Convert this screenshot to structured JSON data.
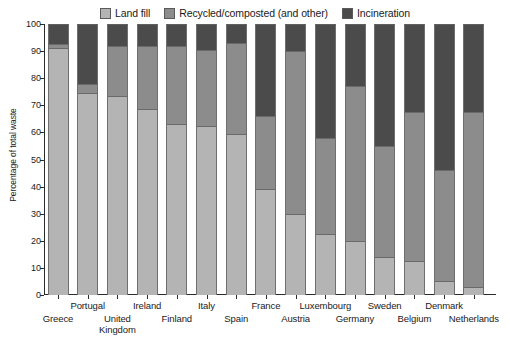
{
  "chart_data": {
    "type": "bar",
    "subtype": "stacked-bar-percentage",
    "title": "",
    "xlabel": "",
    "ylabel": "Percentage of total waste",
    "ylim": [
      0,
      100
    ],
    "ytick_step": 10,
    "yticks": [
      0,
      10,
      20,
      30,
      40,
      50,
      60,
      70,
      80,
      90,
      100
    ],
    "grid": false,
    "legend_position": "top-center",
    "stack_order_bottom_to_top": [
      "Land fill",
      "Recycled/composted (and other)",
      "Incineration"
    ],
    "categories": [
      "Greece",
      "Portugal",
      "United Kingdom",
      "Ireland",
      "Finland",
      "Italy",
      "Spain",
      "France",
      "Austria",
      "Luxembourg",
      "Germany",
      "Sweden",
      "Belgium",
      "Denmark",
      "Netherlands"
    ],
    "series": [
      {
        "name": "Land fill",
        "color": "#b4b4b4",
        "values": [
          91,
          74.5,
          73.5,
          68.5,
          63,
          62.5,
          59.5,
          39,
          30,
          22.5,
          20,
          14,
          12.5,
          5,
          3
        ]
      },
      {
        "name": "Recycled/composted (and other)",
        "color": "#8c8c8c",
        "values": [
          1.5,
          3.5,
          18.5,
          23.5,
          29,
          28,
          33.5,
          27,
          60,
          35.5,
          57,
          41,
          55,
          41,
          64.5
        ]
      },
      {
        "name": "Incineration",
        "color": "#4b4b4b",
        "values": [
          7.5,
          22,
          8,
          8,
          8,
          9.5,
          7,
          34,
          10,
          42,
          23,
          45,
          32.5,
          54,
          32.5
        ]
      }
    ],
    "cumulative_tops": {
      "Greece": [
        91,
        92.5,
        100
      ],
      "Portugal": [
        74.5,
        78,
        100
      ],
      "United Kingdom": [
        73.5,
        92,
        100
      ],
      "Ireland": [
        68.5,
        92,
        100
      ],
      "Finland": [
        63,
        92,
        100
      ],
      "Italy": [
        62.5,
        90.5,
        100
      ],
      "Spain": [
        59.5,
        93,
        100
      ],
      "France": [
        39,
        66,
        100
      ],
      "Austria": [
        30,
        90,
        100
      ],
      "Luxembourg": [
        22.5,
        58,
        100
      ],
      "Germany": [
        20,
        77,
        100
      ],
      "Sweden": [
        14,
        55,
        100
      ],
      "Belgium": [
        12.5,
        67.5,
        100
      ],
      "Denmark": [
        5,
        46,
        100
      ],
      "Netherlands": [
        3,
        67.5,
        100
      ]
    }
  },
  "legend": {
    "items": [
      {
        "label": "Land fill",
        "color": "#b4b4b4"
      },
      {
        "label": "Recycled/composted (and other)",
        "color": "#8c8c8c"
      },
      {
        "label": "Incineration",
        "color": "#4b4b4b"
      }
    ]
  },
  "axes": {
    "y_title": "Percentage of total waste",
    "y_ticks": [
      "100",
      "90",
      "80",
      "70",
      "60",
      "50",
      "40",
      "30",
      "20",
      "10",
      "0"
    ]
  },
  "x_labels": [
    {
      "text": "Greece",
      "row": 1
    },
    {
      "text": "Portugal",
      "row": 0
    },
    {
      "text": "United",
      "text2": "Kingdom",
      "row": 1
    },
    {
      "text": "Ireland",
      "row": 0
    },
    {
      "text": "Finland",
      "row": 1
    },
    {
      "text": "Italy",
      "row": 0
    },
    {
      "text": "Spain",
      "row": 1
    },
    {
      "text": "France",
      "row": 0
    },
    {
      "text": "Austria",
      "row": 1
    },
    {
      "text": "Luxembourg",
      "row": 0
    },
    {
      "text": "Germany",
      "row": 1
    },
    {
      "text": "Sweden",
      "row": 0
    },
    {
      "text": "Belgium",
      "row": 1
    },
    {
      "text": "Denmark",
      "row": 0
    },
    {
      "text": "Netherlands",
      "row": 1
    }
  ]
}
